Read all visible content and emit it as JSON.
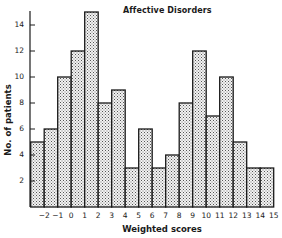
{
  "chart_data": {
    "type": "bar",
    "title": "Affective Disorders",
    "xlabel": "Weighted scores",
    "ylabel": "No. of patients",
    "bin_edges": [
      -3,
      -2,
      -1,
      0,
      1,
      2,
      3,
      4,
      5,
      6,
      7,
      8,
      9,
      10,
      11,
      12,
      13,
      14,
      15
    ],
    "categories": [
      "-3 to -2",
      "-2 to -1",
      "-1 to 0",
      "0 to 1",
      "1 to 2",
      "2 to 3",
      "3 to 4",
      "4 to 5",
      "5 to 6",
      "6 to 7",
      "7 to 8",
      "8 to 9",
      "9 to 10",
      "10 to 11",
      "11 to 12",
      "12 to 13",
      "13 to 14",
      "14 to 15"
    ],
    "values": [
      5,
      6,
      10,
      12,
      15,
      8,
      9,
      3,
      6,
      3,
      4,
      8,
      12,
      7,
      10,
      5,
      3,
      3
    ],
    "x_tick_labels": [
      "−2",
      "−1",
      "0",
      "1",
      "2",
      "3",
      "4",
      "5",
      "6",
      "7",
      "8",
      "9",
      "10",
      "11",
      "12",
      "13",
      "14",
      "15"
    ],
    "y_tick_labels": [
      "2",
      "4",
      "6",
      "8",
      "10",
      "12",
      "14"
    ],
    "y_ticks": [
      2,
      4,
      6,
      8,
      10,
      12,
      14
    ],
    "ylim": [
      0,
      15
    ],
    "grid": false,
    "legend": null,
    "bar_fill": "stippled grey",
    "colors": {
      "bar_edge": "#1a1a1a",
      "bar_fill": "#c9c9c9",
      "axis": "#1a1a1a"
    }
  }
}
